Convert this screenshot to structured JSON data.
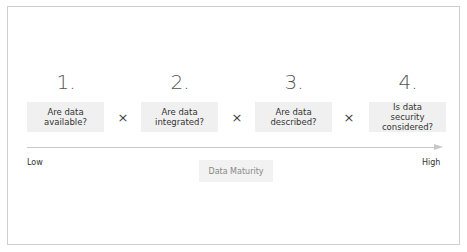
{
  "steps": [
    {
      "number": "1.",
      "question": "Are data available?"
    },
    {
      "number": "2.",
      "question": "Are data integrated?"
    },
    {
      "number": "3.",
      "question": "Are data described?"
    },
    {
      "number": "4.",
      "question": "Is data security considered?"
    }
  ],
  "operator": "×",
  "axis": {
    "low_label": "Low",
    "high_label": "High",
    "title": "Data Maturity"
  },
  "colors": {
    "box_bg": "#f0f0f0",
    "axis": "#c8c8c8",
    "border": "#cfcfcf"
  }
}
